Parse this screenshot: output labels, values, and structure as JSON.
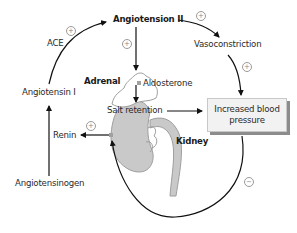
{
  "diagram": {
    "type": "renin-angiotensin-aldosterone feedback loop",
    "nodes": {
      "angiotensin_ii": "Angiotension II",
      "ace": "ACE",
      "angiotensin_i": "Angiotensin I",
      "renin": "Renin",
      "angiotensinogen": "Angiotensinogen",
      "vasoconstriction": "Vasoconstriction",
      "adrenal": "Adrenal",
      "aldosterone": "Aldosterone",
      "salt_retention": "Salt retention",
      "kidney": "Kidney",
      "increased_bp_line1": "Increased blood",
      "increased_bp_line2": "pressure"
    },
    "signs": {
      "plus": "+",
      "minus": "−"
    },
    "edges": [
      {
        "from": "Angiotensinogen",
        "to": "Angiotensin I",
        "sign": ""
      },
      {
        "from": "Renin",
        "to": "Angiotensin I",
        "sign": "+"
      },
      {
        "from": "Angiotensin I",
        "to": "Angiotension II",
        "via": "ACE",
        "sign": "+"
      },
      {
        "from": "Angiotension II",
        "to": "Adrenal",
        "sign": "+"
      },
      {
        "from": "Angiotension II",
        "to": "Vasoconstriction",
        "sign": "+"
      },
      {
        "from": "Vasoconstriction",
        "to": "Increased blood pressure",
        "sign": "+"
      },
      {
        "from": "Aldosterone",
        "to": "Salt retention",
        "sign": ""
      },
      {
        "from": "Salt retention",
        "to": "Increased blood pressure",
        "sign": ""
      },
      {
        "from": "Increased blood pressure",
        "to": "Kidney (renin release)",
        "sign": "−"
      },
      {
        "from": "Kidney",
        "to": "Renin",
        "sign": "+"
      }
    ],
    "colors": {
      "kidney_fill": "#c9c9c9",
      "kidney_stroke": "#9e9e9e",
      "adrenal_fill": "#ffffff",
      "box_fill": "#f2f2f2",
      "box_shadow": "#8c8c8c",
      "arrow": "#111111"
    }
  }
}
